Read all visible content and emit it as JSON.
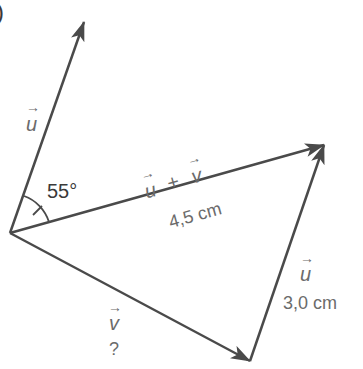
{
  "figure": {
    "corner_label": ")",
    "angle": {
      "value": "55°"
    },
    "vectors": {
      "u_left": {
        "symbol": "u",
        "arrow": "→"
      },
      "sum": {
        "symbol_u": "u",
        "plus": "+",
        "symbol_v": "v",
        "length": "4,5 cm"
      },
      "u_right": {
        "symbol": "u",
        "length": "3,0 cm"
      },
      "v": {
        "symbol": "v",
        "length": "?"
      }
    },
    "colors": {
      "line": "#4a4a4a",
      "label": "#6b6b6b",
      "angle_text": "#3a3a3a"
    }
  }
}
